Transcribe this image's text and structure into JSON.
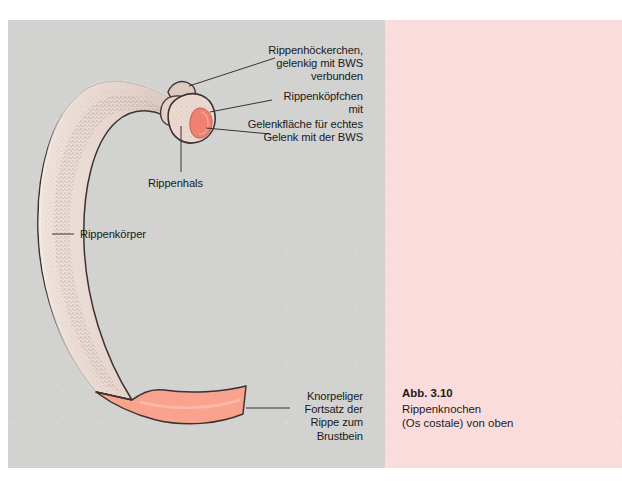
{
  "figure": {
    "panel_left_color": "#d2d2d0",
    "panel_right_color": "#fadcdc",
    "bone_fill": "#e8d8d2",
    "bone_outline": "#3a3330",
    "cartilage_fill": "#f9a28e",
    "facet_color": "#f08070",
    "leader_line_color": "#3a3330"
  },
  "labels": {
    "tubercle": "Rippenhöckerchen,\ngelenkig mit BWS\nverbunden",
    "head": "Rippenköpfchen\nmit",
    "facet": "Gelenkfläche für echtes\nGelenk mit der BWS",
    "neck": "Rippenhals",
    "body": "Rippenkörper",
    "cartilage": "Knorpeliger\nFortsatz der\nRippe zum\nBrustbein"
  },
  "caption": {
    "number": "Abb. 3.10",
    "line1": "Rippenknochen",
    "line2": "(Os costale) von oben"
  }
}
